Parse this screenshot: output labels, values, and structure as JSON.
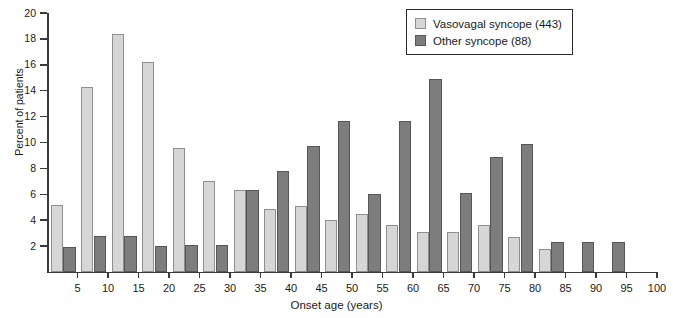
{
  "chart_data": {
    "type": "bar",
    "title": "",
    "xlabel": "Onset age (years)",
    "ylabel": "Percent of patients",
    "xlim": [
      0,
      100
    ],
    "ylim": [
      0,
      20
    ],
    "grid": false,
    "legend_position": "top-right",
    "y_ticks": [
      2,
      4,
      6,
      8,
      10,
      12,
      14,
      16,
      18,
      20
    ],
    "x_ticks": [
      5,
      10,
      15,
      20,
      25,
      30,
      35,
      40,
      45,
      50,
      55,
      60,
      65,
      70,
      75,
      80,
      85,
      90,
      95,
      100
    ],
    "categories": [
      5,
      10,
      15,
      20,
      25,
      30,
      35,
      40,
      45,
      50,
      55,
      60,
      65,
      70,
      75,
      80,
      85,
      90,
      95
    ],
    "series": [
      {
        "name": "Vasovagal syncope (443)",
        "color": "#d6d6d6",
        "values": [
          5.2,
          14.3,
          18.4,
          16.2,
          9.6,
          7.0,
          6.3,
          4.9,
          5.1,
          4.0,
          4.5,
          3.6,
          3.1,
          3.1,
          3.6,
          2.7,
          1.8,
          0,
          0
        ]
      },
      {
        "name": "Other syncope (88)",
        "color": "#7d7d7d",
        "values": [
          1.9,
          2.8,
          2.8,
          2.0,
          2.1,
          2.1,
          6.3,
          7.8,
          9.7,
          11.7,
          6.0,
          11.7,
          14.9,
          6.1,
          8.9,
          9.9,
          2.3,
          2.3,
          2.3
        ]
      }
    ]
  },
  "legend": {
    "items": [
      {
        "label": "Vasovagal syncope (443)",
        "swatch": "light"
      },
      {
        "label": "Other syncope (88)",
        "swatch": "dark"
      }
    ]
  }
}
